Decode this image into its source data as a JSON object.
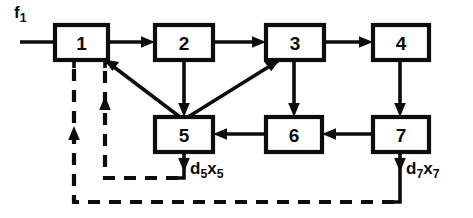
{
  "diagram": {
    "nodes": [
      {
        "id": "n1",
        "label": "1",
        "x": 55,
        "y": 25,
        "w": 53,
        "h": 35
      },
      {
        "id": "n2",
        "label": "2",
        "x": 155,
        "y": 25,
        "w": 58,
        "h": 35
      },
      {
        "id": "n3",
        "label": "3",
        "x": 266,
        "y": 25,
        "w": 58,
        "h": 35
      },
      {
        "id": "n4",
        "label": "4",
        "x": 373,
        "y": 25,
        "w": 56,
        "h": 35
      },
      {
        "id": "n5",
        "label": "5",
        "x": 155,
        "y": 117,
        "w": 58,
        "h": 35
      },
      {
        "id": "n6",
        "label": "6",
        "x": 266,
        "y": 117,
        "w": 56,
        "h": 35
      },
      {
        "id": "n7",
        "label": "7",
        "x": 373,
        "y": 117,
        "w": 56,
        "h": 35
      }
    ],
    "solid_edges": [
      {
        "name": "feed-into-1",
        "from": "f1",
        "to": "n1"
      },
      {
        "name": "edge-1-to-2",
        "from": "n1",
        "to": "n2"
      },
      {
        "name": "edge-2-to-3",
        "from": "n2",
        "to": "n3"
      },
      {
        "name": "edge-3-to-4",
        "from": "n3",
        "to": "n4"
      },
      {
        "name": "edge-5-to-1",
        "from": "n5",
        "to": "n1"
      },
      {
        "name": "edge-2-to-5",
        "from": "n2",
        "to": "n5"
      },
      {
        "name": "edge-5-to-3",
        "from": "n5",
        "to": "n3"
      },
      {
        "name": "edge-3-to-6",
        "from": "n3",
        "to": "n6"
      },
      {
        "name": "edge-4-to-7",
        "from": "n4",
        "to": "n7"
      },
      {
        "name": "edge-7-to-6",
        "from": "n7",
        "to": "n6"
      },
      {
        "name": "edge-6-to-5",
        "from": "n6",
        "to": "n5"
      },
      {
        "name": "edge-5-to-d5",
        "from": "n5",
        "to": "d5x5"
      },
      {
        "name": "edge-7-to-d7",
        "from": "n7",
        "to": "d7x7"
      }
    ],
    "dashed_edges": [
      {
        "name": "recycle-from-5-to-1",
        "from": "d5x5",
        "to": "n1"
      },
      {
        "name": "recycle-from-7-to-1",
        "from": "d7x7",
        "to": "n1"
      }
    ],
    "labels": {
      "feed": {
        "base": "f",
        "sub": "1"
      },
      "output_5": {
        "base_1": "d",
        "sub_1": "5",
        "base_2": "x",
        "sub_2": "5"
      },
      "output_7": {
        "base_1": "d",
        "sub_1": "7",
        "base_2": "x",
        "sub_2": "7"
      }
    },
    "colors": {
      "line": "#0d0d0d",
      "fill": "#ffffff",
      "background": "#ffffff"
    }
  }
}
